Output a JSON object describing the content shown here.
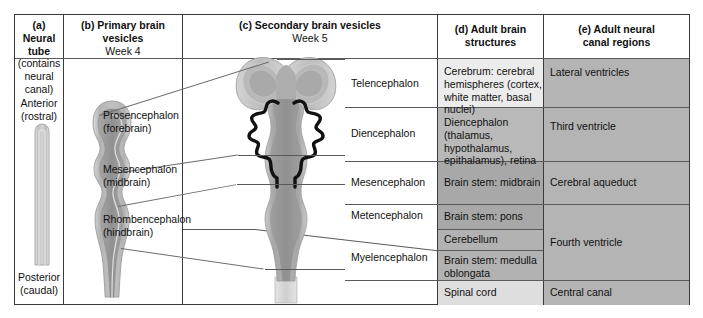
{
  "figure": {
    "columns": [
      {
        "id": "a",
        "title": "(a) Neural",
        "title2": "tube",
        "sub": "(contains",
        "sub2": "neural",
        "sub3": "canal)"
      },
      {
        "id": "b",
        "title": "(b) Primary brain vesicles",
        "sub": "Week 4"
      },
      {
        "id": "c",
        "title": "(c) Secondary brain vesicles",
        "sub": "Week 5"
      },
      {
        "id": "d",
        "title": "(d) Adult brain structures",
        "sub": ""
      },
      {
        "id": "e",
        "title": "(e) Adult neural",
        "title2": "canal regions",
        "sub": ""
      }
    ],
    "col_a": {
      "anterior": "Anterior",
      "anterior_sub": "(rostral)",
      "posterior": "Posterior",
      "posterior_sub": "(caudal)"
    },
    "col_b": {
      "items": [
        {
          "name": "Prosencephalon",
          "sub": "(forebrain)"
        },
        {
          "name": "Mesencephalon",
          "sub": "(midbrain)"
        },
        {
          "name": "Rhombencephalon",
          "sub": "(hindbrain)"
        }
      ]
    },
    "col_c": {
      "items": [
        {
          "name": "Telencephalon"
        },
        {
          "name": "Diencephalon"
        },
        {
          "name": "Mesencephalon"
        },
        {
          "name": "Metencephalon"
        },
        {
          "name": "Myelencephalon"
        }
      ]
    },
    "col_d": {
      "rows": [
        {
          "lines": [
            "Cerebrum: cerebral",
            "hemispheres (cortex,",
            "white matter, basal nuclei)"
          ],
          "shade": "#ececec"
        },
        {
          "lines": [
            "Diencephalon",
            "(thalamus, hypothalamus,",
            "epithalamus), retina"
          ],
          "shade": "#b9b9b9"
        },
        {
          "lines": [
            "Brain stem: midbrain"
          ],
          "shade": "#a8a8a8"
        },
        {
          "lines": [
            "Brain stem: pons"
          ],
          "shade": "#a8a8a8"
        },
        {
          "lines": [
            "Cerebellum"
          ],
          "shade": "#b2b2b2"
        },
        {
          "lines": [
            "Brain stem: medulla",
            "oblongata"
          ],
          "shade": "#b2b2b2"
        },
        {
          "lines": [
            "Spinal cord"
          ],
          "shade": "#dedede"
        }
      ]
    },
    "col_e": {
      "rows": [
        {
          "label": "Lateral ventricles"
        },
        {
          "label": "Third ventricle"
        },
        {
          "label": "Cerebral aqueduct"
        },
        {
          "label": "Fourth ventricle"
        },
        {
          "label": "Central canal"
        }
      ]
    },
    "colors": {
      "border": "#3a3a3a",
      "rule": "#5a5a5a",
      "leader": "#6d6d6d",
      "tissue_outer": "#c9c9c9",
      "tissue_mid": "#ababab",
      "tissue_inner": "#909090",
      "dien_outline": "#111111",
      "spinal_light": "#dcdcdc"
    }
  }
}
